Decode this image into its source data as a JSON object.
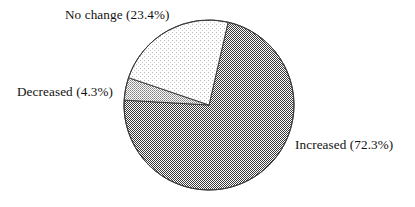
{
  "chart_data": {
    "type": "pie",
    "title": "",
    "subtitle": "",
    "xlabel": "",
    "ylabel": "",
    "legend_position": "none",
    "grid": false,
    "labels_inline": true,
    "categories": [
      "Increased",
      "Decreased",
      "No change"
    ],
    "values": [
      72.3,
      4.3,
      23.4
    ],
    "units": "percent",
    "slices": [
      {
        "name": "Increased",
        "value": 72.3,
        "value_text": "72.3%",
        "label": "Increased (72.3%)",
        "color": "#6e6e6e",
        "pattern": "dense-checker-dither",
        "label_position": "right"
      },
      {
        "name": "Decreased",
        "value": 4.3,
        "value_text": "4.3%",
        "label": "Decreased (4.3%)",
        "color": "#a9a9a9",
        "pattern": "medium-dither",
        "label_position": "left"
      },
      {
        "name": "No change",
        "value": 23.4,
        "value_text": "23.4%",
        "label": "No change (23.4%)",
        "color": "#e4e4e4",
        "pattern": "light-dither",
        "label_position": "top-left"
      }
    ],
    "start_angle_deg": 13,
    "direction": "clockwise",
    "outline_color": "#3a3a3a",
    "background_color": "#ffffff"
  },
  "figure": {
    "background": "#ffffff",
    "center_x": 209,
    "center_y": 105,
    "radius": 85
  }
}
